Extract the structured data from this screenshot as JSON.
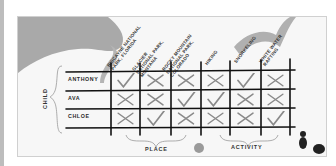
{
  "puzzle": {
    "columns": [
      {
        "label": "BISCAYNE NATIONAL PARK, FLORIDA",
        "line1": "BISCAYNE NATIONAL",
        "line2": "PARK, FLORIDA",
        "line3": ""
      },
      {
        "label": "GLACIER NATIONAL PARK, MONTANA",
        "line1": "GLACIER",
        "line2": "NATIONAL PARK,",
        "line3": "MONTANA"
      },
      {
        "label": "ROCKY MOUNTAIN NATIONAL PARK, COLORADO",
        "line1": "ROCKY MOUNTAIN",
        "line2": "NATIONAL PARK,",
        "line3": "COLORADO"
      },
      {
        "label": "HIKING",
        "line1": "HIKING",
        "line2": "",
        "line3": ""
      },
      {
        "label": "SNORKELING",
        "line1": "SNORKELING",
        "line2": "",
        "line3": ""
      },
      {
        "label": "WHITE WATER RAFTING",
        "line1": "WHITE WATER",
        "line2": "RAFTING",
        "line3": ""
      }
    ],
    "rows": [
      {
        "label": "ANTHONY",
        "marks": [
          "check",
          "x",
          "x",
          "x",
          "check",
          "x"
        ]
      },
      {
        "label": "AVA",
        "marks": [
          "x",
          "x",
          "check",
          "check",
          "x",
          "x"
        ]
      },
      {
        "label": "CHLOE",
        "marks": [
          "x",
          "check",
          "x",
          "x",
          "x",
          "check"
        ]
      }
    ],
    "row_group_label": "CHILD",
    "column_groups": [
      {
        "label": "PLACE"
      },
      {
        "label": "ACTIVITY"
      }
    ]
  },
  "colors": {
    "grid_line": "#111111",
    "mark": "#8a8a8a",
    "decor_gray": "#a9a9a9"
  }
}
